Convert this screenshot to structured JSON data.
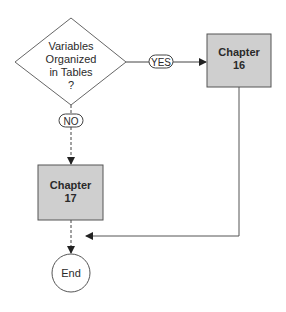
{
  "diagram": {
    "decision": {
      "lines": [
        "Variables",
        "Organized",
        "in Tables",
        "?"
      ]
    },
    "yes_label": "YES",
    "no_label": "NO",
    "chapter16": {
      "line1": "Chapter",
      "line2": "16"
    },
    "chapter17": {
      "line1": "Chapter",
      "line2": "17"
    },
    "end_label": "End",
    "colors": {
      "box_fill": "#cfcfcf",
      "stroke": "#555555",
      "text": "#2a2a2a"
    }
  }
}
